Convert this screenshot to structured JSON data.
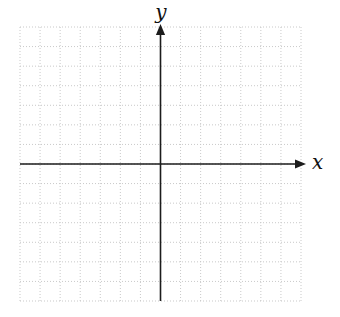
{
  "chart_data": {
    "type": "scatter",
    "title": "",
    "xlabel": "x",
    "ylabel": "y",
    "series": [],
    "annotations": [],
    "xlim": [
      -7,
      7
    ],
    "ylim": [
      -7,
      7
    ],
    "grid": {
      "visible": true,
      "columns": 14,
      "rows": 14,
      "line_style": "dotted"
    },
    "axes": {
      "x_arrow_direction": "right",
      "y_arrow_direction": "up",
      "origin": "center",
      "tick_labels_shown": false
    }
  },
  "colors": {
    "background": "#ffffff",
    "grid_line": "#c9c9c9",
    "axis": "#1c1c1c",
    "label": "#111111"
  }
}
